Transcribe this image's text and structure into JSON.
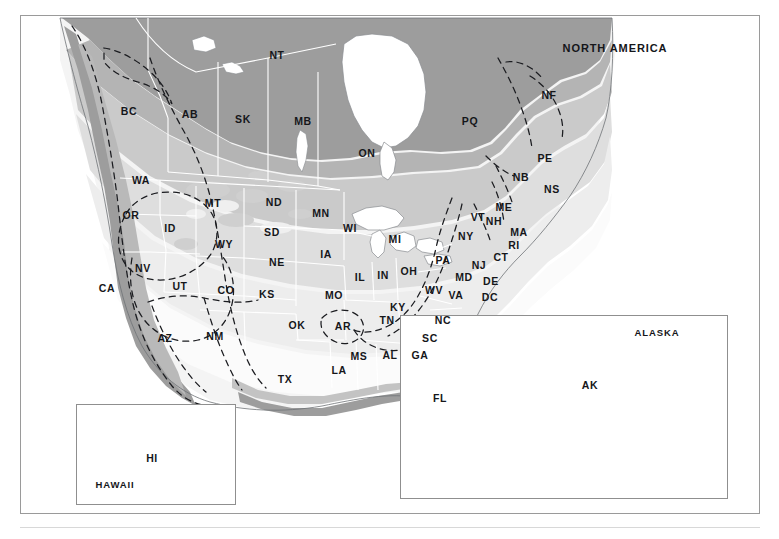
{
  "figure": {
    "type": "thematic-map",
    "region": "North America",
    "title": "NORTH AMERICA",
    "title_pos": [
      615,
      48
    ],
    "frame": {
      "x": 20,
      "y": 15,
      "w": 740,
      "h": 499,
      "border": "#9a9a9a"
    },
    "baseline_rule_y": 527
  },
  "palette": {
    "background": "#ffffff",
    "water": "#ffffff",
    "coast_line": "#6f7276",
    "admin_border": "#ffffff",
    "label_text": "#15161a",
    "frame_border": "#9a9a9a",
    "inset_border": "#8f8f8f",
    "overlay_dash": "#1b1c20",
    "shades": {
      "s1_lightest": "#fbfbfb",
      "s2": "#ededed",
      "s3": "#dedede",
      "s4": "#cacaca",
      "s5": "#b4b4b4",
      "s6": "#9d9d9d",
      "s7_darkest": "#7f7f7f",
      "hawaii_fill": "#3d3f42"
    }
  },
  "insets": [
    {
      "name": "alaska",
      "title": "ALASKA",
      "box": [
        400,
        315,
        328,
        184
      ],
      "title_pos": [
        657,
        333
      ],
      "label": "AK",
      "label_pos": [
        590,
        385
      ]
    },
    {
      "name": "hawaii",
      "title": "HAWAII",
      "box": [
        76,
        404,
        160,
        101
      ],
      "title_pos": [
        115,
        485
      ],
      "label": "HI",
      "label_pos": [
        152,
        458
      ]
    }
  ],
  "labels": {
    "title": "NORTH AMERICA",
    "provinces": [
      {
        "code": "NT",
        "x": 277,
        "y": 55
      },
      {
        "code": "BC",
        "x": 129,
        "y": 111
      },
      {
        "code": "AB",
        "x": 190,
        "y": 114
      },
      {
        "code": "SK",
        "x": 243,
        "y": 119
      },
      {
        "code": "MB",
        "x": 303,
        "y": 121
      },
      {
        "code": "ON",
        "x": 367,
        "y": 153
      },
      {
        "code": "PQ",
        "x": 470,
        "y": 121
      },
      {
        "code": "NF",
        "x": 549,
        "y": 95
      },
      {
        "code": "PE",
        "x": 545,
        "y": 158
      },
      {
        "code": "NB",
        "x": 521,
        "y": 177
      },
      {
        "code": "NS",
        "x": 552,
        "y": 189
      }
    ],
    "states": [
      {
        "code": "WA",
        "x": 141,
        "y": 180
      },
      {
        "code": "OR",
        "x": 131,
        "y": 215
      },
      {
        "code": "ID",
        "x": 170,
        "y": 228
      },
      {
        "code": "MT",
        "x": 213,
        "y": 203
      },
      {
        "code": "WY",
        "x": 224,
        "y": 244
      },
      {
        "code": "NV",
        "x": 143,
        "y": 268
      },
      {
        "code": "UT",
        "x": 180,
        "y": 286
      },
      {
        "code": "CA",
        "x": 107,
        "y": 288
      },
      {
        "code": "AZ",
        "x": 165,
        "y": 338
      },
      {
        "code": "NM",
        "x": 215,
        "y": 336
      },
      {
        "code": "CO",
        "x": 226,
        "y": 290
      },
      {
        "code": "ND",
        "x": 274,
        "y": 202
      },
      {
        "code": "SD",
        "x": 272,
        "y": 232
      },
      {
        "code": "NE",
        "x": 277,
        "y": 262
      },
      {
        "code": "KS",
        "x": 267,
        "y": 294
      },
      {
        "code": "OK",
        "x": 297,
        "y": 325
      },
      {
        "code": "TX",
        "x": 285,
        "y": 379
      },
      {
        "code": "MN",
        "x": 321,
        "y": 213
      },
      {
        "code": "IA",
        "x": 326,
        "y": 254
      },
      {
        "code": "MO",
        "x": 334,
        "y": 295
      },
      {
        "code": "AR",
        "x": 343,
        "y": 326
      },
      {
        "code": "LA",
        "x": 339,
        "y": 370
      },
      {
        "code": "WI",
        "x": 350,
        "y": 228
      },
      {
        "code": "IL",
        "x": 360,
        "y": 277
      },
      {
        "code": "MS",
        "x": 359,
        "y": 356
      },
      {
        "code": "AL",
        "x": 390,
        "y": 355
      },
      {
        "code": "TN",
        "x": 387,
        "y": 320
      },
      {
        "code": "KY",
        "x": 398,
        "y": 307
      },
      {
        "code": "IN",
        "x": 383,
        "y": 275
      },
      {
        "code": "MI",
        "x": 395,
        "y": 239
      },
      {
        "code": "OH",
        "x": 409,
        "y": 271
      },
      {
        "code": "GA",
        "x": 420,
        "y": 355
      },
      {
        "code": "FL",
        "x": 440,
        "y": 398
      },
      {
        "code": "SC",
        "x": 430,
        "y": 338
      },
      {
        "code": "NC",
        "x": 443,
        "y": 320
      },
      {
        "code": "VA",
        "x": 456,
        "y": 295
      },
      {
        "code": "WV",
        "x": 434,
        "y": 290
      },
      {
        "code": "MD",
        "x": 464,
        "y": 277
      },
      {
        "code": "DC",
        "x": 490,
        "y": 297
      },
      {
        "code": "DE",
        "x": 491,
        "y": 281
      },
      {
        "code": "PA",
        "x": 443,
        "y": 260
      },
      {
        "code": "NJ",
        "x": 479,
        "y": 265
      },
      {
        "code": "NY",
        "x": 466,
        "y": 236
      },
      {
        "code": "CT",
        "x": 501,
        "y": 257
      },
      {
        "code": "RI",
        "x": 514,
        "y": 245
      },
      {
        "code": "MA",
        "x": 519,
        "y": 232
      },
      {
        "code": "NH",
        "x": 494,
        "y": 221
      },
      {
        "code": "VT",
        "x": 478,
        "y": 217
      },
      {
        "code": "ME",
        "x": 504,
        "y": 207
      }
    ]
  },
  "legend_note": null
}
